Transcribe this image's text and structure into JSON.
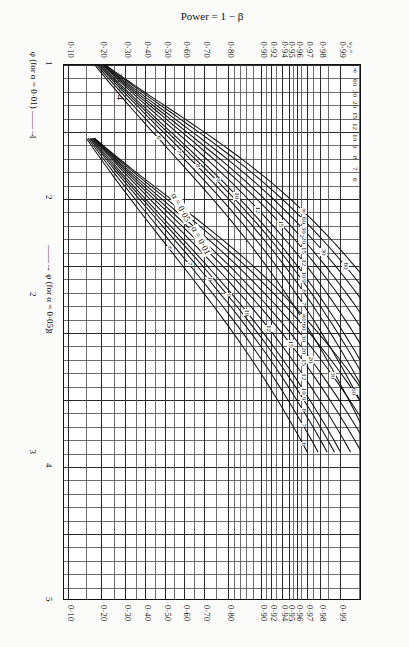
{
  "figure": {
    "y_axis_label": "Power = 1 − β",
    "x_axis_label_a05": "φ (for α = 0·05)",
    "x_axis_label_a01": "φ (for α = 0·01)",
    "alpha_label_a05": "α = 0·05",
    "alpha_label_a01": "α = 0·01",
    "nu2_header": "ν₂ =",
    "arrow": "——→"
  },
  "chart_data": {
    "type": "line",
    "xlabel": "φ",
    "ylabel": "Power = 1 − β",
    "grid": true,
    "legend": "inline-curve-labels",
    "y_scale": "normal-probability",
    "ylim": [
      0.1,
      0.995
    ],
    "y_ticks": [
      "0·99",
      "0·98",
      "0·97",
      "0·96",
      "0·95",
      "0·94",
      "0·92",
      "0·90",
      "0·80",
      "0·70",
      "0·60",
      "0·50",
      "0·40",
      "0·30",
      "0·20",
      "0·10"
    ],
    "y_tick_values": [
      0.99,
      0.98,
      0.97,
      0.96,
      0.95,
      0.94,
      0.92,
      0.9,
      0.8,
      0.7,
      0.6,
      0.5,
      0.4,
      0.3,
      0.2,
      0.1
    ],
    "x_axis_a05": {
      "label": "φ (for α = 0·05)",
      "ticks": [
        "1",
        "2",
        "3",
        "4",
        "5"
      ],
      "range": [
        1,
        5
      ]
    },
    "x_axis_a01": {
      "label": "φ (for α = 0·01)",
      "ticks": [
        "1",
        "2",
        "3"
      ],
      "range": [
        1,
        3
      ]
    },
    "nu2_values": [
      "6",
      "7",
      "8",
      "9",
      "10",
      "12",
      "15",
      "20",
      "30",
      "60",
      "∞"
    ],
    "series_alpha_005": [
      {
        "name": "6"
      },
      {
        "name": "7"
      },
      {
        "name": "8"
      },
      {
        "name": "9"
      },
      {
        "name": "10"
      },
      {
        "name": "12"
      },
      {
        "name": "15"
      },
      {
        "name": "20"
      },
      {
        "name": "30"
      },
      {
        "name": "60"
      },
      {
        "name": "∞"
      }
    ],
    "series_alpha_001": [
      {
        "name": "6"
      },
      {
        "name": "7"
      },
      {
        "name": "8"
      },
      {
        "name": "9"
      },
      {
        "name": "10"
      },
      {
        "name": "12"
      },
      {
        "name": "15"
      },
      {
        "name": "20"
      },
      {
        "name": "30"
      },
      {
        "name": "60"
      },
      {
        "name": "∞"
      }
    ]
  },
  "labels": {
    "curve_numbers": [
      "6",
      "7",
      "8",
      "9",
      "10",
      "12",
      "15",
      "20",
      "30",
      "60",
      "∞"
    ]
  }
}
